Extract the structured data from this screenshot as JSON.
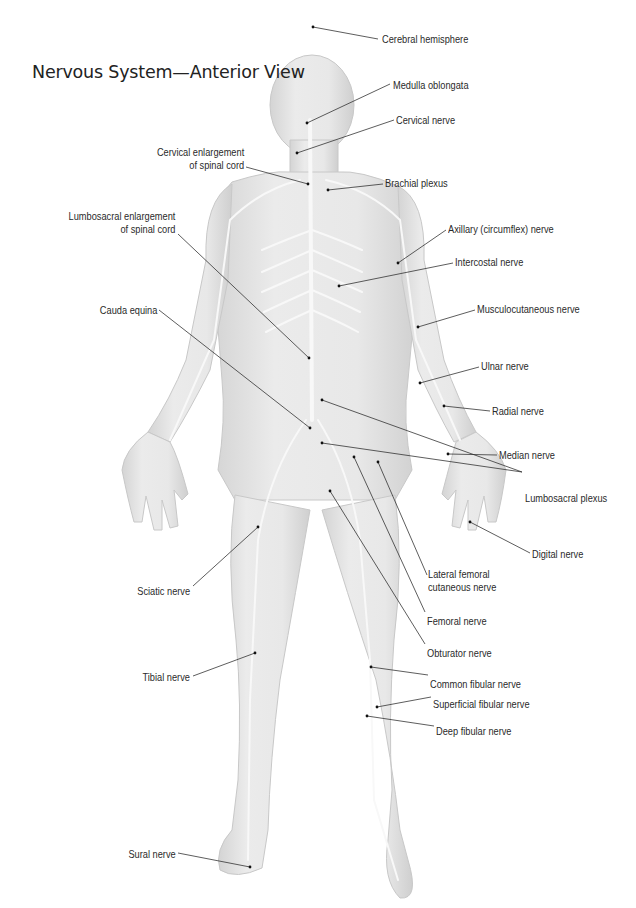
{
  "title": "Nervous System—Anterior View",
  "colors": {
    "background": "#ffffff",
    "body_fill": "#e6e6e6",
    "body_shade": "#d2d2d2",
    "nerve": "#f7f7f7",
    "leader_line": "#333333",
    "text": "#2a2a2a"
  },
  "labels": [
    {
      "id": "cerebral-hemisphere",
      "text": "Cerebral hemisphere",
      "side": "left",
      "x": 382,
      "y": 33,
      "line": [
        [
          378,
          39
        ],
        [
          313,
          27
        ]
      ]
    },
    {
      "id": "medulla-oblongata",
      "text": "Medulla oblongata",
      "side": "left",
      "x": 393,
      "y": 79,
      "line": [
        [
          390,
          84
        ],
        [
          307,
          123
        ]
      ]
    },
    {
      "id": "cervical-nerve",
      "text": "Cervical nerve",
      "side": "left",
      "x": 396,
      "y": 114,
      "line": [
        [
          394,
          120
        ],
        [
          297,
          153
        ]
      ]
    },
    {
      "id": "cervical-enlargement",
      "text": "Cervical enlargement\nof spinal cord",
      "side": "right",
      "x": 244,
      "y": 146,
      "line": [
        [
          246,
          167
        ],
        [
          308,
          184
        ]
      ]
    },
    {
      "id": "brachial-plexus",
      "text": "Brachial plexus",
      "side": "left",
      "x": 385,
      "y": 177,
      "line": [
        [
          383,
          184
        ],
        [
          328,
          190
        ]
      ]
    },
    {
      "id": "lumbosacral-enlargement",
      "text": "Lumbosacral enlargement\nof spinal cord",
      "side": "right",
      "x": 175,
      "y": 210,
      "line": [
        [
          178,
          234
        ],
        [
          309,
          358
        ]
      ]
    },
    {
      "id": "axillary-nerve",
      "text": "Axillary (circumflex) nerve",
      "side": "left",
      "x": 448,
      "y": 223,
      "line": [
        [
          446,
          230
        ],
        [
          398,
          263
        ]
      ]
    },
    {
      "id": "intercostal-nerve",
      "text": "Intercostal nerve",
      "side": "left",
      "x": 455,
      "y": 256,
      "line": [
        [
          453,
          263
        ],
        [
          339,
          286
        ]
      ]
    },
    {
      "id": "musculocutaneous-nerve",
      "text": "Musculocutaneous nerve",
      "side": "left",
      "x": 477,
      "y": 303,
      "line": [
        [
          475,
          310
        ],
        [
          418,
          327
        ]
      ]
    },
    {
      "id": "cauda-equina",
      "text": "Cauda equina",
      "side": "right",
      "x": 157,
      "y": 304,
      "line": [
        [
          159,
          310
        ],
        [
          310,
          428
        ]
      ]
    },
    {
      "id": "ulnar-nerve",
      "text": "Ulnar nerve",
      "side": "left",
      "x": 481,
      "y": 360,
      "line": [
        [
          479,
          367
        ],
        [
          420,
          383
        ]
      ]
    },
    {
      "id": "radial-nerve",
      "text": "Radial nerve",
      "side": "left",
      "x": 492,
      "y": 405,
      "line": [
        [
          490,
          411
        ],
        [
          444,
          406
        ]
      ]
    },
    {
      "id": "median-nerve",
      "text": "Median nerve",
      "side": "left",
      "x": 499,
      "y": 449,
      "line": [
        [
          497,
          455
        ],
        [
          448,
          454
        ]
      ]
    },
    {
      "id": "lumbosacral-plexus",
      "text": "Lumbosacral plexus",
      "side": "left",
      "x": 525,
      "y": 492,
      "line": [
        [
          522,
          472
        ],
        [
          322,
          400
        ]
      ],
      "line2": [
        [
          522,
          472
        ],
        [
          322,
          443
        ]
      ]
    },
    {
      "id": "digital-nerve",
      "text": "Digital nerve",
      "side": "left",
      "x": 532,
      "y": 548,
      "line": [
        [
          530,
          553
        ],
        [
          470,
          522
        ]
      ]
    },
    {
      "id": "lateral-femoral-cutaneous-nerve",
      "text": "Lateral femoral\ncutaneous nerve",
      "side": "left",
      "x": 428,
      "y": 568,
      "line": [
        [
          427,
          575
        ],
        [
          378,
          462
        ]
      ]
    },
    {
      "id": "sciatic-nerve",
      "text": "Sciatic nerve",
      "side": "right",
      "x": 190,
      "y": 585,
      "line": [
        [
          193,
          586
        ],
        [
          258,
          527
        ]
      ]
    },
    {
      "id": "femoral-nerve",
      "text": "Femoral nerve",
      "side": "left",
      "x": 427,
      "y": 615,
      "line": [
        [
          425,
          612
        ],
        [
          354,
          457
        ]
      ]
    },
    {
      "id": "obturator-nerve",
      "text": "Obturator nerve",
      "side": "left",
      "x": 427,
      "y": 647,
      "line": [
        [
          425,
          644
        ],
        [
          330,
          491
        ]
      ]
    },
    {
      "id": "common-fibular-nerve",
      "text": "Common fibular nerve",
      "side": "left",
      "x": 430,
      "y": 678,
      "line": [
        [
          428,
          675
        ],
        [
          371,
          667
        ]
      ]
    },
    {
      "id": "tibial-nerve",
      "text": "Tibial nerve",
      "side": "right",
      "x": 190,
      "y": 671,
      "line": [
        [
          193,
          676
        ],
        [
          255,
          653
        ]
      ]
    },
    {
      "id": "superficial-fibular-nerve",
      "text": "Superficial fibular nerve",
      "side": "left",
      "x": 433,
      "y": 698,
      "line": [
        [
          431,
          697
        ],
        [
          377,
          707
        ]
      ]
    },
    {
      "id": "deep-fibular-nerve",
      "text": "Deep fibular nerve",
      "side": "left",
      "x": 436,
      "y": 725,
      "line": [
        [
          434,
          726
        ],
        [
          367,
          716
        ]
      ]
    },
    {
      "id": "sural-nerve",
      "text": "Sural nerve",
      "side": "right",
      "x": 176,
      "y": 848,
      "line": [
        [
          178,
          853
        ],
        [
          250,
          867
        ]
      ]
    }
  ]
}
